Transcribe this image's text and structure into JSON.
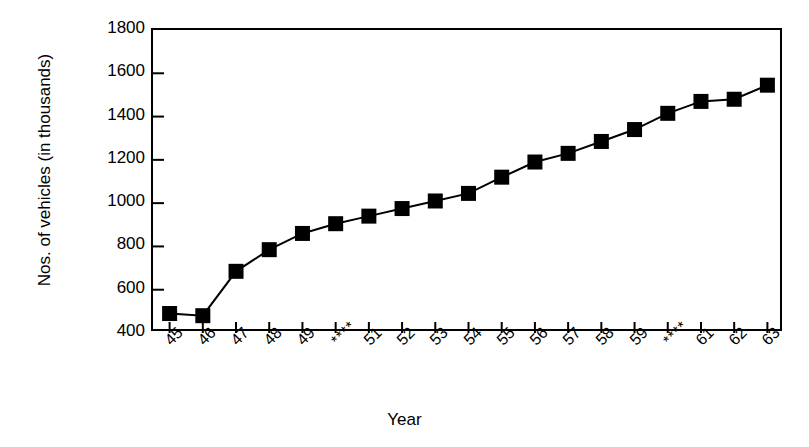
{
  "chart_data": {
    "type": "line",
    "title": "",
    "subtitle": "",
    "xlabel": "Year",
    "ylabel": "Nos. of vehicles (in thousands)",
    "categories": [
      "45",
      "46",
      "47",
      "48",
      "49",
      "****",
      "51",
      "52",
      "53",
      "54",
      "55",
      "56",
      "57",
      "58",
      "59",
      "****",
      "61",
      "62",
      "63"
    ],
    "values": [
      490,
      480,
      685,
      785,
      860,
      905,
      940,
      975,
      1010,
      1045,
      1120,
      1190,
      1230,
      1285,
      1340,
      1415,
      1470,
      1480,
      1545
    ],
    "series": [
      {
        "name": "Nos. of vehicles",
        "values": [
          490,
          480,
          685,
          785,
          860,
          905,
          940,
          975,
          1010,
          1045,
          1120,
          1190,
          1230,
          1285,
          1340,
          1415,
          1470,
          1480,
          1545
        ]
      }
    ],
    "ylim": [
      400,
      1800
    ],
    "yticks": [
      400,
      600,
      800,
      1000,
      1200,
      1400,
      1600,
      1800
    ],
    "ytick_labels": [
      "400",
      "600",
      "800",
      "1000",
      "1200",
      "1400",
      "1600",
      "1800"
    ],
    "grid": false,
    "legend": null,
    "legend_position": "none",
    "marker": "square",
    "marker_color": "#000000",
    "line_color": "#000000",
    "background_color": "#ffffff",
    "axis_color": "#000000",
    "xtick_rotation": -45,
    "annotations": []
  }
}
